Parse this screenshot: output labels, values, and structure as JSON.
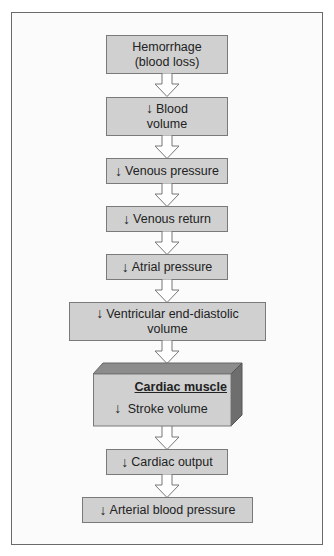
{
  "diagram": {
    "down_arrow_symbol": "↓",
    "nodes": [
      {
        "id": "hemorrhage",
        "line1": "Hemorrhage",
        "line2": "(blood loss)",
        "decrease": false
      },
      {
        "id": "blood-volume",
        "line1": "Blood",
        "line2": "volume",
        "decrease": true
      },
      {
        "id": "venous-pressure",
        "line1": "Venous pressure",
        "decrease": true
      },
      {
        "id": "venous-return",
        "line1": "Venous return",
        "decrease": true
      },
      {
        "id": "atrial-pressure",
        "line1": "Atrial pressure",
        "decrease": true
      },
      {
        "id": "ventricular-edv",
        "line1": "Ventricular end-diastolic",
        "line2": "volume",
        "decrease": true
      },
      {
        "id": "cardiac-muscle",
        "title": "Cardiac muscle",
        "line1": "Stroke volume",
        "decrease": true
      },
      {
        "id": "cardiac-output",
        "line1": "Cardiac output",
        "decrease": true
      },
      {
        "id": "arterial-bp",
        "line1": "Arterial blood pressure",
        "decrease": true
      }
    ],
    "colors": {
      "box_fill": "#d0d0d0",
      "box_border": "#7a7a7a",
      "cube_top": "#8c8c8c",
      "cube_side": "#6e6e6e",
      "arrow_fill": "#ffffff",
      "frame_border": "#6a6a6a"
    }
  }
}
